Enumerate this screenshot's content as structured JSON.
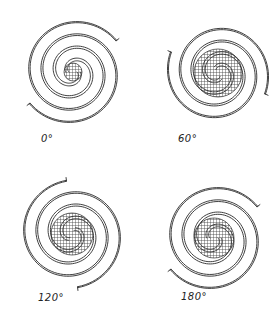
{
  "figure": {
    "ink_color": "#2a2a2a",
    "hatch_color": "#3a3a3a",
    "background": "#ffffff"
  },
  "panels": [
    {
      "label": "0°",
      "cx": 73,
      "cy": 72,
      "core_r": 9,
      "rotation": 0,
      "outer_r": 56
    },
    {
      "label": "60°",
      "cx": 218,
      "cy": 73,
      "core_r": 24,
      "rotation": 60,
      "outer_r": 54
    },
    {
      "label": "120°",
      "cx": 72,
      "cy": 234,
      "core_r": 21,
      "rotation": 120,
      "outer_r": 56
    },
    {
      "label": "180°",
      "cx": 214,
      "cy": 238,
      "core_r": 20,
      "rotation": 180,
      "outer_r": 56
    }
  ]
}
